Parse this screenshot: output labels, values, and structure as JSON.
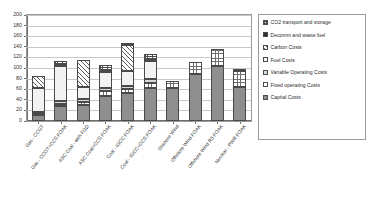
{
  "chart_data": {
    "type": "bar",
    "subtype": "stacked-column",
    "title": "",
    "xlabel": "",
    "ylabel": "",
    "ylim": [
      0,
      200
    ],
    "ytick_step": 20,
    "yticks": [
      "0",
      "20",
      "40",
      "60",
      "80",
      "100",
      "120",
      "140",
      "160",
      "180",
      "200"
    ],
    "grid": true,
    "legend_position": "right",
    "categories": [
      "Gas - CCGT",
      "Gas - CCGT+CCS FOAK",
      "ASC Coal - with FGD",
      "ASC Coal+CCS FOAK",
      "Coal - IGCC FOAK",
      "Coal - IGCC+CCS FOAK",
      "Onshore Wind",
      "Offshore Wind FOAK",
      "Offshore Wind R3 FOAK",
      "Nuclear - PWR FOAK"
    ],
    "series": [
      {
        "name": "Capital Costs",
        "pattern": "solid-dark-gray",
        "values": [
          12,
          28,
          30,
          48,
          52,
          62,
          62,
          88,
          104,
          64
        ]
      },
      {
        "name": "Fixed operating Costs",
        "pattern": "fine-grid",
        "values": [
          3,
          5,
          6,
          8,
          8,
          10,
          14,
          24,
          31,
          30
        ]
      },
      {
        "name": "Variable Operating Costs",
        "pattern": "light-gray",
        "values": [
          2,
          4,
          5,
          7,
          7,
          8,
          0,
          0,
          0,
          0
        ]
      },
      {
        "name": "Fuel Costs",
        "pattern": "very-light-gray",
        "values": [
          45,
          66,
          24,
          30,
          28,
          34,
          0,
          0,
          0,
          0
        ]
      },
      {
        "name": "Carbon Costs",
        "pattern": "diagonal-hatch",
        "values": [
          23,
          0,
          50,
          0,
          48,
          0,
          0,
          0,
          0,
          0
        ]
      },
      {
        "name": "Decomm and waste fuel",
        "pattern": "solid-black",
        "values": [
          0,
          2,
          0,
          2,
          2,
          2,
          0,
          0,
          0,
          5
        ]
      },
      {
        "name": "CO2 transport and storage",
        "pattern": "checker-grid",
        "values": [
          0,
          8,
          0,
          10,
          0,
          11,
          0,
          0,
          0,
          0
        ]
      }
    ],
    "totals": [
      85,
      113,
      115,
      133,
      145,
      140,
      76,
      112,
      135,
      99
    ]
  },
  "legend": {
    "items": [
      {
        "label": "CO2 transport and storage",
        "pattern_class": "f-co2"
      },
      {
        "label": "Decomm and waste fuel",
        "pattern_class": "f-decomm"
      },
      {
        "label": "Carbon Costs",
        "pattern_class": "f-carbon"
      },
      {
        "label": "Fuel Costs",
        "pattern_class": "f-fuel"
      },
      {
        "label": "Variable Operating Costs",
        "pattern_class": "f-variable"
      },
      {
        "label": "Fixed operating Costs",
        "pattern_class": "f-fixed"
      },
      {
        "label": "Capital Costs",
        "pattern_class": "f-capital"
      }
    ]
  },
  "colors": {
    "capital": "#8f8f8f",
    "variable": "#d9d9d9",
    "fuel": "#f2f2f2",
    "decomm": "#2f2f2f",
    "grid": "#c8c8c8",
    "axis": "#6d6d6d",
    "text": "#2e2e2e"
  }
}
